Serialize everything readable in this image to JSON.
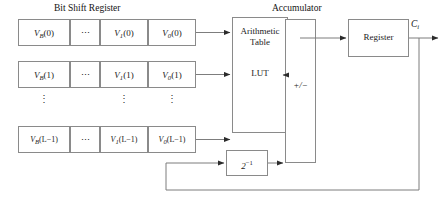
{
  "figure": {
    "type": "block-diagram"
  },
  "titles": {
    "bit_shift_register": "Bit Shift Register",
    "accumulator": "Accumulator"
  },
  "shift_register": {
    "rows": [
      {
        "cells": [
          "V_B(0)",
          "⋯",
          "V_1(0)",
          "V_0(0)"
        ]
      },
      {
        "cells": [
          "V_B(1)",
          "⋯",
          "V_1(1)",
          "V_0(1)"
        ]
      },
      {
        "cells": [
          "V_B(L−1)",
          "⋯",
          "V_1(L−1)",
          "V_0(L−1)"
        ]
      }
    ],
    "row_labels": {
      "r0c0_base": "V",
      "r0c0_sub": "B",
      "r0c0_arg": "(0)",
      "r0c2_base": "V",
      "r0c2_sub": "1",
      "r0c2_arg": "(0)",
      "r0c3_base": "V",
      "r0c3_sub": "0",
      "r0c3_arg": "(0)",
      "r1c0_base": "V",
      "r1c0_sub": "B",
      "r1c0_arg": "(1)",
      "r1c2_base": "V",
      "r1c2_sub": "1",
      "r1c2_arg": "(1)",
      "r1c3_base": "V",
      "r1c3_sub": "0",
      "r1c3_arg": "(1)",
      "r2c0_base": "V",
      "r2c0_sub": "B",
      "r2c0_arg": "(L−1)",
      "r2c2_base": "V",
      "r2c2_sub": "1",
      "r2c2_arg": "(L−1)",
      "r2c3_base": "V",
      "r2c3_sub": "0",
      "r2c3_arg": "(L−1)"
    },
    "ellipsis_horizontal": "⋯",
    "ellipsis_vertical": "⋮"
  },
  "blocks": {
    "lut": {
      "line1": "Arithmetic",
      "line2": "Table",
      "line3": "LUT"
    },
    "accumulator": {
      "label": "+/−"
    },
    "register": {
      "label": "Register"
    },
    "scaler": {
      "base": "2",
      "exponent": "−1"
    }
  },
  "signals": {
    "output_base": "C",
    "output_sub": "i"
  },
  "colors": {
    "stroke": "#7d7d7d",
    "arrowhead": "#2b2b2b",
    "text": "#141414",
    "background": "#ffffff"
  }
}
